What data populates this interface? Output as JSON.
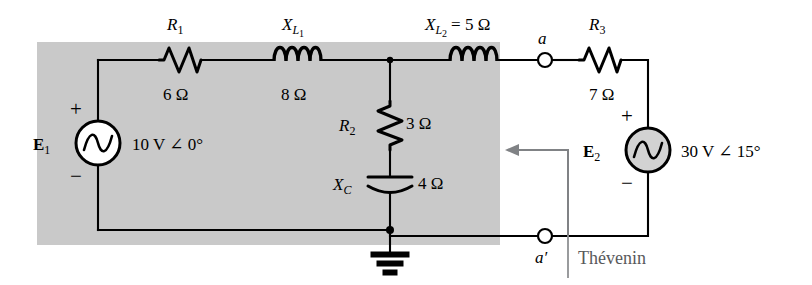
{
  "figure": {
    "shaded_region_color": "#c9c9c9",
    "background_color": "#ffffff",
    "wire_color": "#000000",
    "annotation_color": "#808285"
  },
  "sources": {
    "e1": {
      "name": "E",
      "subscript": "1",
      "value": "10 V ∠ 0°",
      "plus": "+",
      "minus": "−"
    },
    "e2": {
      "name": "E",
      "subscript": "2",
      "value": "30 V ∠ 15°",
      "plus": "+",
      "minus": "−"
    }
  },
  "components": {
    "r1": {
      "name": "R",
      "subscript": "1",
      "value": "6 Ω"
    },
    "r2": {
      "name": "R",
      "subscript": "2",
      "value": "3 Ω"
    },
    "r3": {
      "name": "R",
      "subscript": "3",
      "value": "7 Ω"
    },
    "xl1": {
      "name": "X",
      "subscript": "L",
      "subsubscript": "1",
      "value": "8 Ω"
    },
    "xl2": {
      "name": "X",
      "subscript": "L",
      "subsubscript": "2",
      "equals": "= 5 Ω"
    },
    "xc": {
      "name": "X",
      "subscript": "C",
      "value": "4 Ω"
    }
  },
  "terminals": {
    "a": "a",
    "a_prime": "a′"
  },
  "annotations": {
    "thevenin_label": "Thévenin"
  }
}
